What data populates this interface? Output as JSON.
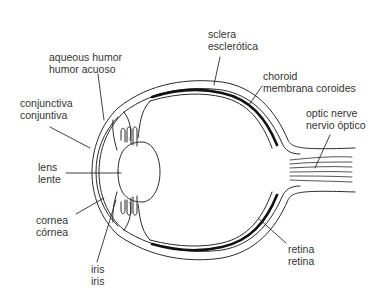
{
  "diagram": {
    "labels": [
      {
        "id": "sclera",
        "en": "sclera",
        "es": "esclerótica"
      },
      {
        "id": "aqueous-humor",
        "en": "aqueous humor",
        "es": "humor acuoso"
      },
      {
        "id": "choroid",
        "en": "choroid",
        "es": "membrana coroides"
      },
      {
        "id": "conjunctiva",
        "en": "conjunctiva",
        "es": "conjuntiva"
      },
      {
        "id": "optic-nerve",
        "en": "optic nerve",
        "es": "nervio óptico"
      },
      {
        "id": "lens",
        "en": "lens",
        "es": "lente"
      },
      {
        "id": "cornea",
        "en": "cornea",
        "es": "córnea"
      },
      {
        "id": "retina",
        "en": "retina",
        "es": "retina"
      },
      {
        "id": "iris",
        "en": "iris",
        "es": "iris"
      }
    ],
    "colors": {
      "line": "#2a2a2a",
      "choroid": "#111111",
      "background": "#ffffff"
    }
  }
}
